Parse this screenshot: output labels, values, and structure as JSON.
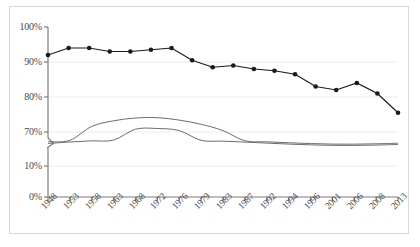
{
  "chart_data": {
    "type": "line",
    "title": "",
    "xlabel": "",
    "ylabel": "",
    "grid": true,
    "legend": "none",
    "axis_break": {
      "present": true,
      "between": [
        70,
        10
      ],
      "note": "y-axis is broken between 70% and 10%"
    },
    "ylim": [
      0,
      100
    ],
    "ytick_labels": [
      "100%",
      "90%",
      "80%",
      "70%",
      "10%",
      "0%"
    ],
    "ytick_values": [
      100,
      90,
      80,
      70,
      10,
      0
    ],
    "categories": [
      "1948",
      "1953",
      "1958",
      "1963",
      "1968",
      "1972",
      "1976",
      "1979",
      "1983",
      "1987",
      "1992",
      "1994",
      "1996",
      "2001",
      "2006",
      "2008",
      "2013"
    ],
    "series": [
      {
        "name": "primary-series",
        "color": "#1a1a1a",
        "markers": true,
        "values": [
          92.0,
          94.0,
          94.0,
          93.0,
          93.0,
          93.5,
          94.0,
          90.5,
          88.5,
          89.0,
          88.0,
          87.5,
          86.5,
          83.0,
          82.0,
          84.0,
          81.0
        ]
      },
      {
        "name": "upper-band-curve",
        "color": "#6d6d6d",
        "markers": false,
        "values": [
          66.0,
          69.2,
          71.6,
          73.2,
          74.0,
          74.1,
          73.4,
          72.2,
          70.4,
          68.2,
          65.8,
          63.6,
          61.8,
          60.5,
          60.4,
          61.2,
          62.6
        ]
      },
      {
        "name": "lower-band-curve",
        "color": "#6d6d6d",
        "markers": false,
        "values": [
          62.0,
          65.4,
          68.0,
          69.8,
          70.8,
          71.0,
          70.4,
          69.2,
          67.4,
          65.2,
          62.8,
          60.6,
          58.8,
          57.6,
          57.5,
          58.3,
          59.7
        ]
      }
    ],
    "trailing_point": {
      "label": "2013",
      "value": 75.5
    }
  }
}
